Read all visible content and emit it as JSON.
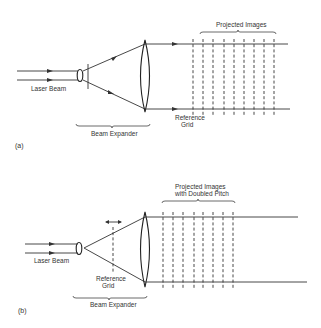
{
  "figure": {
    "panels": [
      {
        "id": "a",
        "panel_label": "(a)",
        "labels": {
          "laser_beam": "Laser Beam",
          "beam_expander": "Beam Expander",
          "reference_grid_line1": "Reference",
          "reference_grid_line2": "Grid",
          "projected_images": "Projected Images"
        },
        "projected_line_count": 9,
        "components": [
          "laser-beam",
          "collimating-lens",
          "aperture",
          "expander-lens",
          "reference-grid",
          "projected-images"
        ]
      },
      {
        "id": "b",
        "panel_label": "(b)",
        "labels": {
          "laser_beam": "Laser Beam",
          "beam_expander": "Beam Expander",
          "reference_grid_line1": "Reference",
          "reference_grid_line2": "Grid",
          "projected_images_line1": "Projected Images",
          "projected_images_line2": "with Doubled Pitch"
        },
        "projected_line_count": 8,
        "components": [
          "laser-beam",
          "collimating-lens",
          "movable-reference-grid",
          "expander-lens",
          "projected-images-doubled-pitch"
        ]
      }
    ],
    "colors": {
      "ink": "#333333",
      "background": "#ffffff"
    }
  }
}
